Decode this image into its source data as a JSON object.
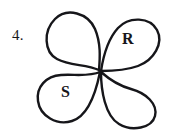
{
  "figure": {
    "problem_number": "4.",
    "shape_name": "four-petal-clover-outline",
    "stroke_color": "#16161a",
    "fill_color": "#ffffff",
    "background_color": "#ffffff",
    "labels": [
      {
        "text": "R",
        "petal": "top-right"
      },
      {
        "text": "S",
        "petal": "bottom-left"
      }
    ],
    "petals": [
      {
        "name": "top-left",
        "label": ""
      },
      {
        "name": "top-right",
        "label": "R"
      },
      {
        "name": "bottom-left",
        "label": "S"
      },
      {
        "name": "bottom-right",
        "label": ""
      }
    ]
  }
}
